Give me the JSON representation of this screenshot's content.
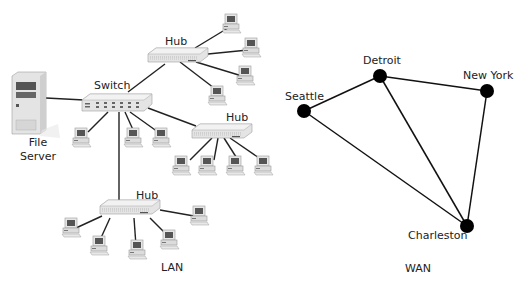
{
  "lan": {
    "caption": "LAN",
    "file_server_label_line1": "File",
    "file_server_label_line2": "Server",
    "switch_label": "Switch",
    "hub_top_label": "Hub",
    "hub_right_label": "Hub",
    "hub_bottom_label": "Hub",
    "devices": {
      "file_server": {
        "x": 12,
        "y": 72
      },
      "switch": {
        "x": 82,
        "y": 96
      },
      "hub_top": {
        "x": 148,
        "y": 48
      },
      "hub_right": {
        "x": 192,
        "y": 124
      },
      "hub_bottom": {
        "x": 100,
        "y": 200
      }
    }
  },
  "wan": {
    "caption": "WAN",
    "nodes": [
      {
        "id": "seattle",
        "label": "Seattle",
        "x": 304,
        "y": 111
      },
      {
        "id": "detroit",
        "label": "Detroit",
        "x": 380,
        "y": 76
      },
      {
        "id": "new_york",
        "label": "New York",
        "x": 487,
        "y": 91
      },
      {
        "id": "charleston",
        "label": "Charleston",
        "x": 467,
        "y": 226
      }
    ],
    "links": [
      [
        "seattle",
        "detroit"
      ],
      [
        "detroit",
        "new_york"
      ],
      [
        "seattle",
        "charleston"
      ],
      [
        "detroit",
        "charleston"
      ],
      [
        "new_york",
        "charleston"
      ]
    ]
  }
}
